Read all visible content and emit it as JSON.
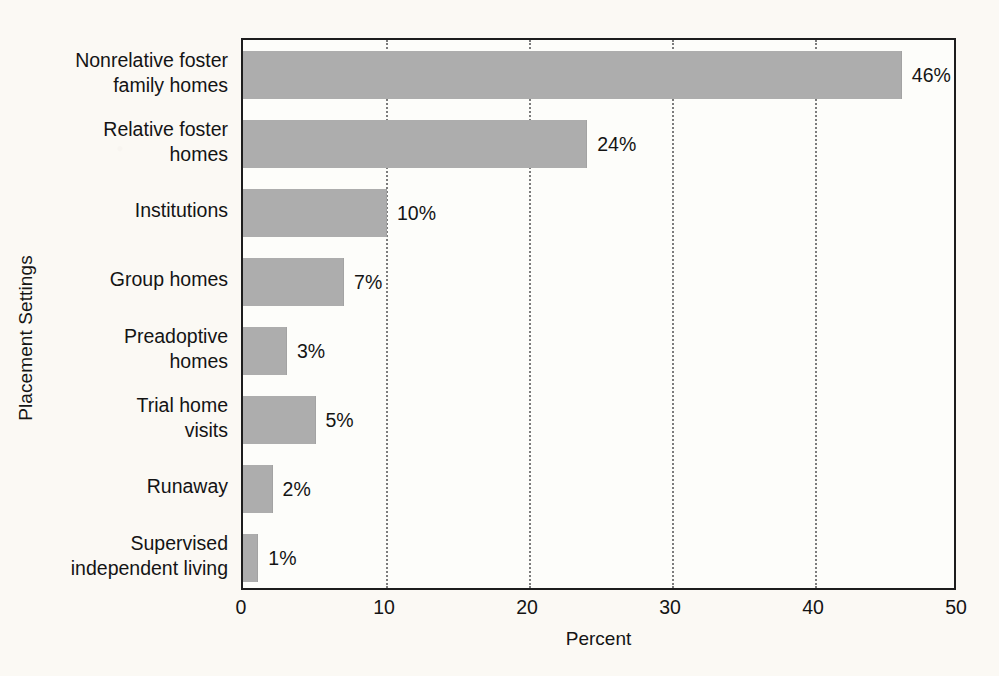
{
  "chart_data": {
    "type": "bar",
    "orientation": "horizontal",
    "title": "",
    "xlabel": "Percent",
    "ylabel": "Placement Settings",
    "xlim": [
      0,
      50
    ],
    "xticks": [
      0,
      10,
      20,
      30,
      40,
      50
    ],
    "xtick_labels": [
      "0",
      "10",
      "20",
      "30",
      "40",
      "50"
    ],
    "grid": "vertical-dotted",
    "legend": "none",
    "bar_color": "#adadad",
    "axis_color": "#1d1d1d",
    "gridline_color": "#7c7c7c",
    "background_color": "#fdfdfa",
    "page_background_color": "#fbf9f4",
    "categories": [
      "Nonrelative foster\nfamily homes",
      "Relative foster\nhomes",
      "Institutions",
      "Group homes",
      "Preadoptive\nhomes",
      "Trial home\nvisits",
      "Runaway",
      "Supervised\nindependent living"
    ],
    "values": [
      46,
      24,
      10,
      7,
      3,
      5,
      2,
      1
    ],
    "value_labels": [
      "46%",
      "24%",
      "10%",
      "7%",
      "3%",
      "5%",
      "2%",
      "1%"
    ]
  }
}
